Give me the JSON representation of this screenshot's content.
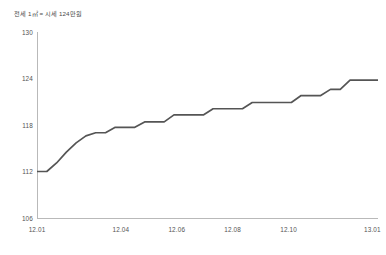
{
  "caption": "전세 1㎡ = 시세 124만원",
  "colors": {
    "line": "#555555",
    "axis": "#b9b9b9",
    "tick_text": "#545454",
    "background": "#ffffff"
  },
  "chart_data": {
    "type": "line",
    "title": "전세 1㎡ = 시세 124만원",
    "xlabel": "",
    "ylabel": "",
    "ylim": [
      106,
      130
    ],
    "yticks": [
      106,
      112,
      118,
      124,
      130
    ],
    "ytick_labels": [
      "106",
      "112",
      "118",
      "124",
      "130"
    ],
    "xticks": [
      0,
      3,
      5,
      7,
      9,
      12
    ],
    "xtick_labels": [
      "12.01",
      "12.04",
      "12.06",
      "12.08",
      "12.10",
      "13.01"
    ],
    "grid": false,
    "legend": null,
    "line_style": "step-like monotone increase",
    "x": [
      0,
      0.35,
      0.7,
      1.05,
      1.4,
      1.75,
      2.1,
      2.45,
      2.8,
      3.15,
      3.5,
      3.85,
      4.2,
      4.55,
      4.9,
      5.25,
      5.6,
      5.95,
      6.3,
      6.65,
      7.0,
      7.35,
      7.7,
      8.05,
      8.4,
      8.75,
      9.1,
      9.45,
      9.8,
      10.15,
      10.5,
      10.85,
      11.2,
      11.55,
      11.9,
      12.2
    ],
    "values": [
      112.0,
      112.0,
      113.1,
      114.5,
      115.7,
      116.6,
      117.0,
      117.0,
      117.7,
      117.7,
      117.7,
      118.4,
      118.4,
      118.4,
      119.3,
      119.3,
      119.3,
      119.3,
      120.1,
      120.1,
      120.1,
      120.1,
      120.9,
      120.9,
      120.9,
      120.9,
      120.9,
      121.8,
      121.8,
      121.8,
      122.6,
      122.6,
      123.8,
      123.8,
      123.8,
      123.8
    ],
    "series": [
      {
        "name": "전세가",
        "values": [
          112.0,
          112.0,
          113.1,
          114.5,
          115.7,
          116.6,
          117.0,
          117.0,
          117.7,
          117.7,
          117.7,
          118.4,
          118.4,
          118.4,
          119.3,
          119.3,
          119.3,
          119.3,
          120.1,
          120.1,
          120.1,
          120.1,
          120.9,
          120.9,
          120.9,
          120.9,
          120.9,
          121.8,
          121.8,
          121.8,
          122.6,
          122.6,
          123.8,
          123.8,
          123.8,
          123.8
        ]
      }
    ]
  }
}
